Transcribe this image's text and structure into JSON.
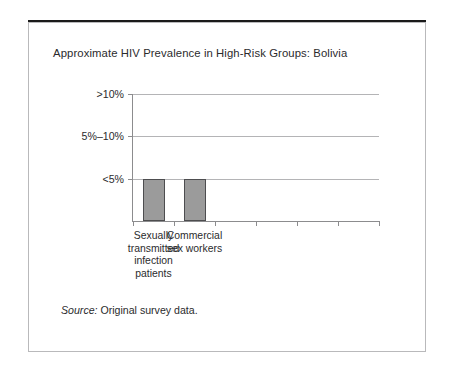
{
  "figure": {
    "title": "Approximate HIV Prevalence in High-Risk Groups: Bolivia",
    "source_label": "Source:",
    "source_text": " Original survey data."
  },
  "chart_data": {
    "type": "bar",
    "title": "Approximate HIV Prevalence in High-Risk Groups: Bolivia",
    "xlabel": "",
    "ylabel": "",
    "categories": [
      "Sexually\ntransmitted\ninfection\npatients",
      "Commercial\nsex workers"
    ],
    "categories_flat": [
      "Sexually transmitted infection patients",
      "Commercial sex workers"
    ],
    "values": [
      1,
      1
    ],
    "value_labels": [
      "<5%",
      "<5%"
    ],
    "y_ticks": [
      "<5%",
      "5%–10%",
      ">10%"
    ],
    "y_tick_values": [
      1,
      2,
      3
    ],
    "ylim": [
      0,
      3
    ],
    "category_slots": 6,
    "grid": true,
    "legend": false,
    "bar_color": "#9b9b9b",
    "bar_border_color": "#4d4d4f",
    "axis_color": "#8c8c8e",
    "grid_color": "#b4b4b6"
  }
}
